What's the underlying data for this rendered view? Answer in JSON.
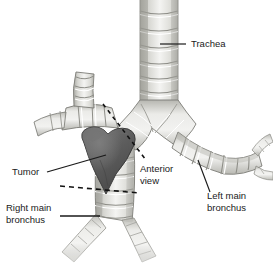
{
  "figure": {
    "view_note": "Anterior view",
    "background_color": "#ffffff",
    "ink_color": "#1a1a1a"
  },
  "colors": {
    "cartilage_light": "#f2f2f0",
    "cartilage_mid": "#d8d8d4",
    "cartilage_shadow": "#b4b4ae",
    "cartilage_dark": "#9a9a94",
    "outline": "#6f6f6a",
    "tumor_fill": "#5a5a5a",
    "tumor_dark": "#4a4a4a",
    "tumor_highlight": "#6e6e6e",
    "leader": "#1a1a1a",
    "dashed": "#111111"
  },
  "labels": {
    "trachea": {
      "text": "Trachea",
      "x": 191,
      "y": 47
    },
    "tumor": {
      "text": "Tumor",
      "x": 12,
      "y": 174
    },
    "anterior_view": {
      "line1": "Anterior",
      "line2": "view",
      "x": 140,
      "y": 172
    },
    "right_main_bronchus": {
      "line1": "Right main",
      "line2": "bronchus",
      "x": 6,
      "y": 212
    },
    "left_main_bronchus": {
      "line1": "Left main",
      "line2": "bronchus",
      "x": 207,
      "y": 200
    }
  },
  "annotations": {
    "dashed_upper": "oblique sectioning plane above carina",
    "dashed_lower": "horizontal sectioning plane below tumor"
  },
  "structures": {
    "trachea": "trachea",
    "carina": "carina",
    "right_main_bronchus": "right-main-bronchus",
    "left_main_bronchus": "left-main-bronchus",
    "right_upper_lobe_bronchus": "right-upper-lobe-bronchus",
    "tumor": "tumor-mass"
  }
}
